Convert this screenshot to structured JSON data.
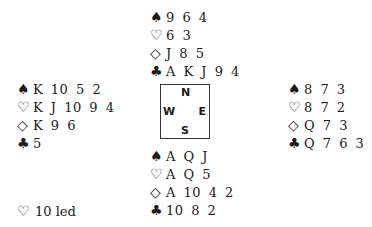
{
  "suit_symbols": {
    "spades": "♠",
    "hearts": "♡",
    "diamonds": "◇",
    "clubs": "♣"
  },
  "hands": {
    "north": {
      "spades": "9 6 4",
      "hearts": "6 3",
      "diamonds": "J 8 5",
      "clubs": "A K J 9 4"
    },
    "west": {
      "spades": "K 10 5 2",
      "hearts": "K J 10 9 4",
      "diamonds": "K 9 6",
      "clubs": "5"
    },
    "east": {
      "spades": "8 7 3",
      "hearts": "8 7 2",
      "diamonds": "Q 7 3",
      "clubs": "Q 7 6 3"
    },
    "south": {
      "spades": "A Q J",
      "hearts": "A Q 5",
      "diamonds": "A 10 4 2",
      "clubs": "10 8 2"
    }
  },
  "compass": {
    "n": "N",
    "s": "S",
    "w": "W",
    "e": "E"
  },
  "lead": {
    "suit": "♡",
    "text": "10 led"
  }
}
